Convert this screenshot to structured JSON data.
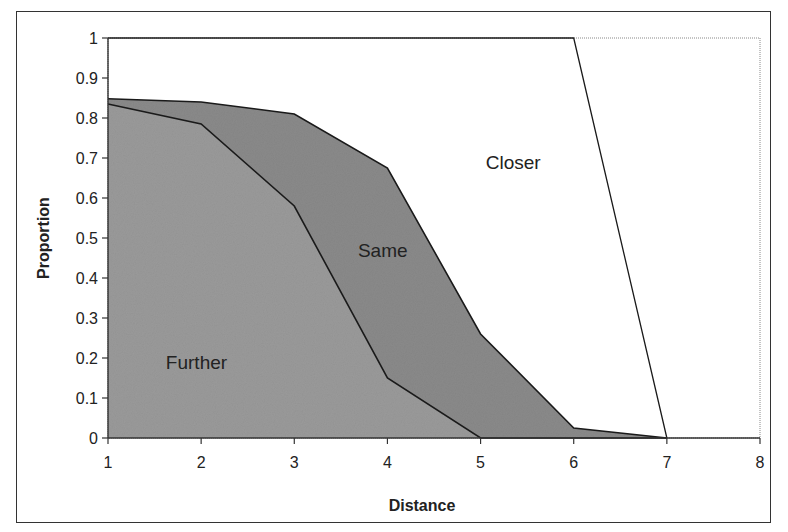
{
  "chart_data": {
    "type": "area",
    "title": "",
    "xlabel": "Distance",
    "ylabel": "Proportion",
    "x": [
      1,
      2,
      3,
      4,
      5,
      6,
      7
    ],
    "xlim": [
      1,
      8
    ],
    "ylim": [
      0,
      1
    ],
    "xticks": [
      "1",
      "2",
      "3",
      "4",
      "5",
      "6",
      "7",
      "8"
    ],
    "yticks": [
      "0",
      "0.1",
      "0.2",
      "0.3",
      "0.4",
      "0.5",
      "0.6",
      "0.7",
      "0.8",
      "0.9",
      "1"
    ],
    "grid": false,
    "legend": "none (regions labeled inline)",
    "stacked": true,
    "series": [
      {
        "name": "Further",
        "values": [
          0.835,
          0.785,
          0.58,
          0.15,
          0.0,
          0.0,
          0.0
        ],
        "color": "#9a9a9a"
      },
      {
        "name": "Same",
        "values": [
          0.013,
          0.055,
          0.23,
          0.525,
          0.26,
          0.025,
          0.0
        ],
        "color": "#8a8a8a"
      },
      {
        "name": "Closer",
        "values": [
          0.152,
          0.16,
          0.19,
          0.325,
          0.74,
          0.975,
          0.0
        ],
        "color": "#ffffff"
      }
    ],
    "cumulative_boundaries": {
      "further_top": [
        0.835,
        0.785,
        0.58,
        0.15,
        0.0,
        0.0,
        0.0
      ],
      "same_top": [
        0.848,
        0.84,
        0.81,
        0.675,
        0.26,
        0.025,
        0.0
      ],
      "closer_top": [
        1.0,
        1.0,
        1.0,
        1.0,
        1.0,
        1.0,
        0.0
      ]
    },
    "region_labels": [
      {
        "text": "Further",
        "x": 1.95,
        "y": 0.19
      },
      {
        "text": "Same",
        "x": 3.95,
        "y": 0.47
      },
      {
        "text": "Closer",
        "x": 5.35,
        "y": 0.69
      }
    ]
  }
}
